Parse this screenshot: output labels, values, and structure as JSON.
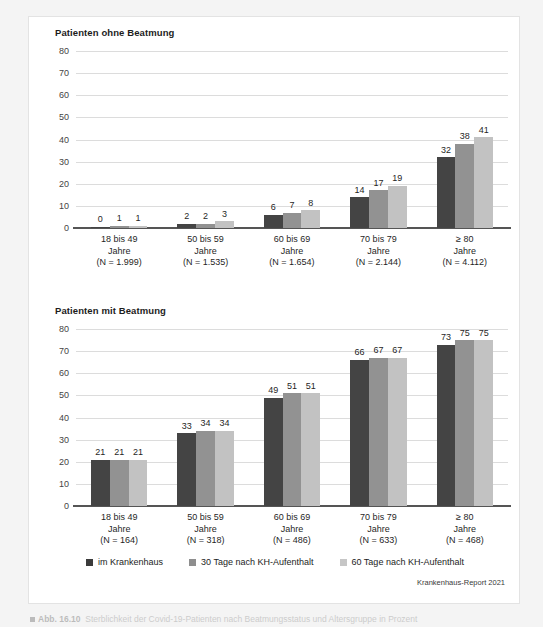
{
  "figure": {
    "source_note": "Krankenhaus-Report 2021",
    "caption_marker": "Abb. 16.10",
    "caption_text": "Sterblichkeit der Covid-19-Patienten nach Beatmungsstatus und Altersgruppe in Prozent"
  },
  "legend": {
    "items": [
      {
        "label": "im Krankenhaus",
        "color": "#3b3b3b"
      },
      {
        "label": "30 Tage nach KH-Aufenthalt",
        "color": "#8e8e8e"
      },
      {
        "label": "60 Tage nach KH-Aufenthalt",
        "color": "#c6c6c6"
      }
    ]
  },
  "chart_data": [
    {
      "type": "bar",
      "title": "Patienten ohne Beatmung",
      "xlabel": "",
      "ylabel": "",
      "ylim": [
        0,
        80
      ],
      "yticks": [
        80,
        70,
        60,
        50,
        40,
        30,
        20,
        10,
        0
      ],
      "grid": true,
      "legend_position": "bottom",
      "categories": [
        "18 bis 49\nJahre\n(N = 1.999)",
        "50 bis 59\nJahre\n(N = 1.535)",
        "60 bis 69\nJahre\n(N = 1.654)",
        "70 bis 79\nJahre\n(N = 2.144)",
        "≥ 80\nJahre\n(N = 4.112)"
      ],
      "category_lines": [
        [
          "18 bis 49",
          "Jahre",
          "(N = 1.999)"
        ],
        [
          "50 bis 59",
          "Jahre",
          "(N = 1.535)"
        ],
        [
          "60 bis 69",
          "Jahre",
          "(N = 1.654)"
        ],
        [
          "70 bis 79",
          "Jahre",
          "(N = 2.144)"
        ],
        [
          "≥ 80",
          "Jahre",
          "(N = 4.112)"
        ]
      ],
      "series": [
        {
          "name": "im Krankenhaus",
          "color": "#444444",
          "values": [
            0,
            2,
            6,
            14,
            32
          ]
        },
        {
          "name": "30 Tage nach KH-Aufenthalt",
          "color": "#929292",
          "values": [
            1,
            2,
            7,
            17,
            38
          ]
        },
        {
          "name": "60 Tage nach KH-Aufenthalt",
          "color": "#c2c2c2",
          "values": [
            1,
            3,
            8,
            19,
            41
          ]
        }
      ]
    },
    {
      "type": "bar",
      "title": "Patienten mit Beatmung",
      "xlabel": "",
      "ylabel": "",
      "ylim": [
        0,
        80
      ],
      "yticks": [
        80,
        70,
        60,
        50,
        40,
        30,
        20,
        10,
        0
      ],
      "grid": true,
      "legend_position": "bottom",
      "categories": [
        "18 bis 49\nJahre\n(N = 164)",
        "50 bis 59\nJahre\n(N = 318)",
        "60 bis 69\nJahre\n(N = 486)",
        "70 bis 79\nJahre\n(N = 633)",
        "≥ 80\nJahre\n(N = 468)"
      ],
      "category_lines": [
        [
          "18 bis 49",
          "Jahre",
          "(N = 164)"
        ],
        [
          "50 bis 59",
          "Jahre",
          "(N = 318)"
        ],
        [
          "60 bis 69",
          "Jahre",
          "(N = 486)"
        ],
        [
          "70 bis 79",
          "Jahre",
          "(N = 633)"
        ],
        [
          "≥ 80",
          "Jahre",
          "(N = 468)"
        ]
      ],
      "series": [
        {
          "name": "im Krankenhaus",
          "color": "#444444",
          "values": [
            21,
            33,
            49,
            66,
            73
          ]
        },
        {
          "name": "30 Tage nach KH-Aufenthalt",
          "color": "#929292",
          "values": [
            21,
            34,
            51,
            67,
            75
          ]
        },
        {
          "name": "60 Tage nach KH-Aufenthalt",
          "color": "#c2c2c2",
          "values": [
            21,
            34,
            51,
            67,
            75
          ]
        }
      ]
    }
  ]
}
